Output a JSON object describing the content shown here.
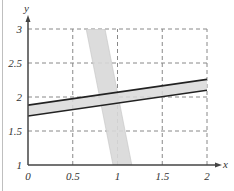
{
  "chart_data": {
    "type": "line",
    "title": "",
    "xlabel": "x",
    "ylabel": "y",
    "xlim": [
      0,
      2
    ],
    "ylim": [
      1,
      3
    ],
    "grid": true,
    "grid_style": "dashed",
    "x_ticks": [
      "0",
      "0.5",
      "1",
      "1.5",
      "2"
    ],
    "y_ticks": [
      "1",
      "1.5",
      "2",
      "2.5",
      "3"
    ],
    "series": [
      {
        "name": "shallow-band",
        "kind": "band",
        "upper": {
          "x": [
            0,
            2
          ],
          "y": [
            1.88,
            2.26
          ]
        },
        "lower": {
          "x": [
            0,
            2
          ],
          "y": [
            1.72,
            2.1
          ]
        },
        "fill": "#d9d9d9",
        "edge": "#222222"
      },
      {
        "name": "steep-band",
        "kind": "band",
        "left": {
          "x": [
            0.65,
            0.95
          ],
          "y": [
            3,
            1
          ]
        },
        "right": {
          "x": [
            0.86,
            1.16
          ],
          "y": [
            3,
            1
          ]
        },
        "fill": "#d9d9d9",
        "edge": "none"
      }
    ],
    "colors": {
      "axis": "#444444",
      "grid": "#888888",
      "band_fill": "#d9d9d9",
      "band_edge": "#222222"
    }
  }
}
